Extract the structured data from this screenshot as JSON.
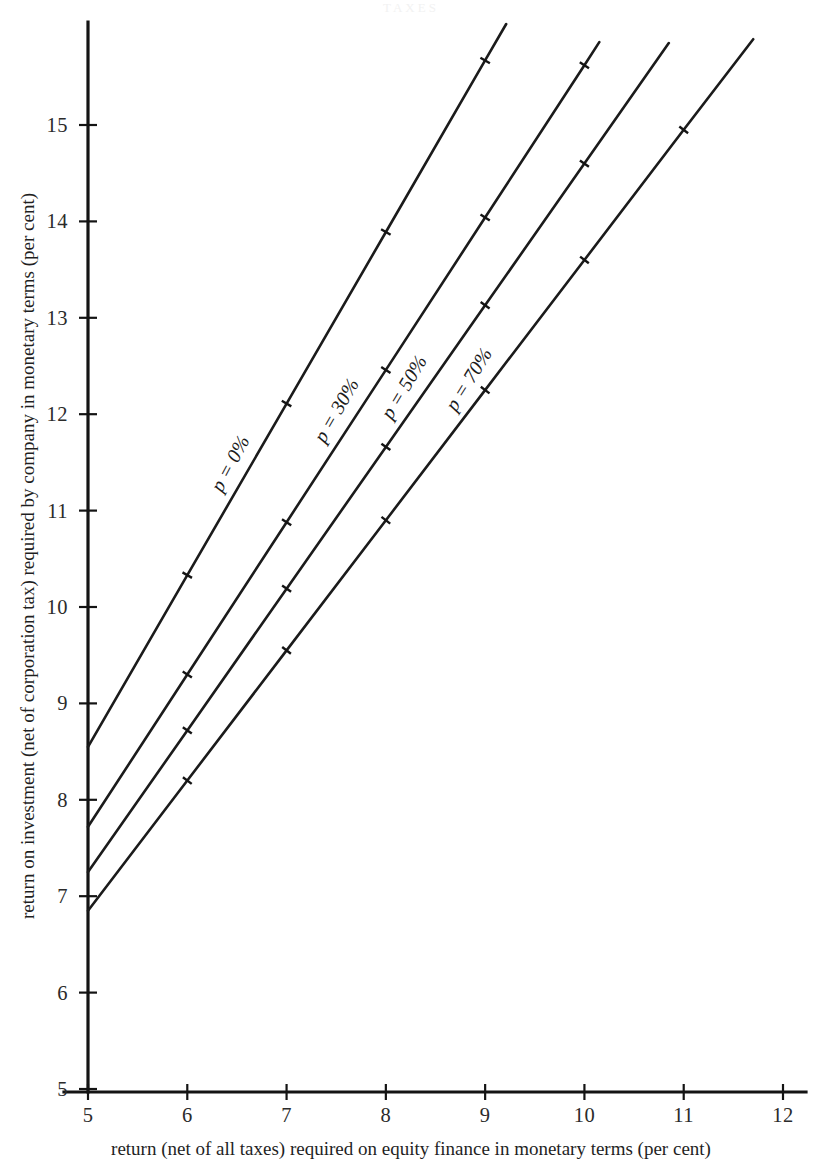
{
  "figure": {
    "faint_header": "TAXES",
    "background_color": "#ffffff",
    "line_color": "#1b1b1b"
  },
  "axes": {
    "x": {
      "title": "return (net of all taxes) required on equity finance in monetary terms (per cent)",
      "ticks": [
        "5",
        "6",
        "7",
        "8",
        "9",
        "10",
        "11",
        "12"
      ],
      "min": 5,
      "max": 12
    },
    "y": {
      "title": "return on investment (net of corporation tax) required by company in monetary terms (per cent)",
      "ticks": [
        "5",
        "6",
        "7",
        "8",
        "9",
        "10",
        "11",
        "12",
        "13",
        "14",
        "15"
      ],
      "min": 5,
      "max": 15.9
    }
  },
  "series_labels": {
    "s0": "p = 0%",
    "s1": "p = 30%",
    "s2": "p = 50%",
    "s3": "p = 70%"
  },
  "chart_data": {
    "type": "line",
    "title": "",
    "subtitle": "",
    "xlabel": "return (net of all taxes) required on equity finance in monetary terms (per cent)",
    "ylabel": "return on investment (net of corporation tax) required by company in monetary terms (per cent)",
    "xlim": [
      5,
      12
    ],
    "ylim": [
      5,
      15.9
    ],
    "xticks": [
      5,
      6,
      7,
      8,
      9,
      10,
      11,
      12
    ],
    "yticks": [
      5,
      6,
      7,
      8,
      9,
      10,
      11,
      12,
      13,
      14,
      15
    ],
    "grid": false,
    "legend": "inline-curve-labels",
    "series": [
      {
        "name": "p = 0%",
        "label": "p = 0%",
        "x": [
          5,
          6,
          7,
          8,
          9,
          9.32
        ],
        "y": [
          8.55,
          10.33,
          12.11,
          13.89,
          15.67,
          16.24
        ],
        "marked_points": [
          [
            6,
            10.33
          ],
          [
            7,
            12.11
          ],
          [
            8,
            13.89
          ],
          [
            9,
            15.67
          ]
        ],
        "slope": 1.78,
        "intercept_at_x5": 8.55
      },
      {
        "name": "p = 30%",
        "label": "p = 30%",
        "x": [
          5,
          6,
          7,
          8,
          9,
          10,
          10.15
        ],
        "y": [
          7.72,
          9.3,
          10.88,
          12.46,
          14.04,
          15.62,
          15.86
        ],
        "marked_points": [
          [
            6,
            9.3
          ],
          [
            7,
            10.88
          ],
          [
            8,
            12.46
          ],
          [
            9,
            14.04
          ],
          [
            10,
            15.62
          ]
        ],
        "slope": 1.58,
        "intercept_at_x5": 7.72
      },
      {
        "name": "p = 50%",
        "label": "p = 50%",
        "x": [
          5,
          6,
          7,
          8,
          9,
          10,
          10.85
        ],
        "y": [
          7.25,
          8.72,
          10.19,
          11.66,
          13.13,
          14.6,
          15.85
        ],
        "marked_points": [
          [
            6,
            8.72
          ],
          [
            7,
            10.19
          ],
          [
            8,
            11.66
          ],
          [
            9,
            13.13
          ],
          [
            10,
            14.6
          ]
        ],
        "slope": 1.47,
        "intercept_at_x5": 7.25
      },
      {
        "name": "p = 70%",
        "label": "p = 70%",
        "x": [
          5,
          6,
          7,
          8,
          9,
          10,
          11,
          11.7
        ],
        "y": [
          6.85,
          8.2,
          9.55,
          10.9,
          12.25,
          13.6,
          14.95,
          15.89
        ],
        "marked_points": [
          [
            6,
            8.2
          ],
          [
            7,
            9.55
          ],
          [
            8,
            10.9
          ],
          [
            9,
            12.25
          ],
          [
            10,
            13.6
          ],
          [
            11,
            14.95
          ]
        ],
        "slope": 1.35,
        "intercept_at_x5": 6.85
      }
    ]
  }
}
